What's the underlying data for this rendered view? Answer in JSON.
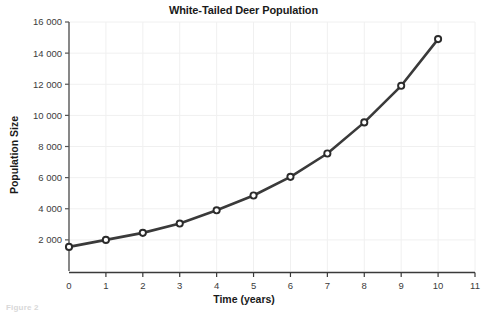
{
  "figure": {
    "caption_fragment": "Figure 2"
  },
  "chart_data": {
    "type": "line",
    "title": "White-Tailed Deer Population",
    "xlabel": "Time (years)",
    "ylabel": "Population Size",
    "x": [
      0,
      1,
      2,
      3,
      4,
      5,
      6,
      7,
      8,
      9,
      10
    ],
    "values": [
      1550,
      2000,
      2450,
      3050,
      3900,
      4850,
      6050,
      7550,
      9550,
      11900,
      14900
    ],
    "series": [
      {
        "name": "White-Tailed Deer Population",
        "values": [
          1550,
          2000,
          2450,
          3050,
          3900,
          4850,
          6050,
          7550,
          9550,
          11900,
          14900
        ]
      }
    ],
    "xlim": [
      0,
      11
    ],
    "ylim": [
      0,
      16000
    ],
    "xticks": [
      0,
      1,
      2,
      3,
      4,
      5,
      6,
      7,
      8,
      9,
      10,
      11
    ],
    "xtick_labels": [
      "0",
      "1",
      "2",
      "3",
      "4",
      "5",
      "6",
      "7",
      "8",
      "9",
      "10",
      "11"
    ],
    "yticks": [
      2000,
      4000,
      6000,
      8000,
      10000,
      12000,
      14000,
      16000
    ],
    "ytick_labels": [
      "2 000",
      "4 000",
      "6 000",
      "8 000",
      "10 000",
      "12 000",
      "14 000",
      "16 000"
    ],
    "grid": true,
    "legend": null,
    "colors": {
      "line": "#3a3a3a",
      "marker_fill": "#ffffff",
      "marker_edge": "#2b2b2b",
      "grid": "#f0f0f0",
      "axis": "#555555",
      "text": "#1a1a1a",
      "background": "#ffffff"
    }
  }
}
